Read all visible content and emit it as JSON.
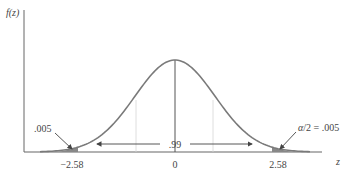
{
  "chart_data": {
    "type": "line",
    "title": "",
    "xlabel": "z",
    "ylabel": "f(z)",
    "x_ticks": [
      "-2.58",
      "0",
      "2.58"
    ],
    "curve": "standard normal density",
    "annotations": {
      "center_area": ".99",
      "left_tail": ".005",
      "right_tail": "α/2 = .005"
    },
    "colors": {
      "curve": "#7a7a7a",
      "axis": "#555555",
      "guide": "#cfcfcf",
      "tail": "#888888"
    }
  },
  "labels": {
    "ylabel": "f(z)",
    "xlabel": "z",
    "tick_left": "−2.58",
    "tick_center": "0",
    "tick_right": "2.58",
    "center_area": ".99",
    "left_tail": ".005",
    "right_tail": "α/2 = .005"
  }
}
